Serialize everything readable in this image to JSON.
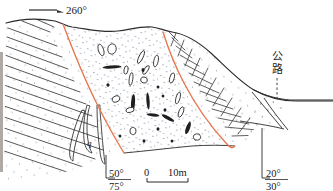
{
  "figure": {
    "type": "geological-cross-section",
    "caption_labels": {
      "direction_arrow": "260°",
      "road": "公路",
      "unit_label": "q",
      "scale_zero": "0",
      "scale_max": "10m",
      "dip_left_upper": "50°",
      "dip_left_lower": "75°",
      "dip_right_upper": "20°",
      "dip_right_lower": "30°"
    },
    "colors": {
      "fault": "#e8764c",
      "outline": "#2b2b2b",
      "hatch": "#3a3a3a",
      "stipple": "#4a5a7a",
      "text": "#1a1a1a",
      "background": "#ffffff"
    },
    "legend_notes": {
      "left_unit": "bedded rock with parallel bedding traces",
      "center_unit": "stippled breccia with scattered elongate clasts",
      "right_unit": "bedded rock with dense cross hatch"
    }
  },
  "geometry": {
    "topography": "M 6 23 C 20 19, 38 18, 55 21 C 62 23, 66 26, 72 27 C 88 29, 104 33, 118 31 C 132 29, 142 26, 152 27 C 160 28, 165 31, 172 32 C 186 34, 200 43, 212 54 C 226 67, 240 82, 254 90 C 268 98, 282 101, 296 101 L 333 101",
    "fault_left": "M 63 24 C 72 48, 84 78, 97 104 C 106 122, 116 140, 124 153",
    "fault_right": "M 163 32 C 168 48, 175 66, 184 83 C 196 106, 212 128, 226 143 C 230 148, 233 149, 235 146",
    "base_left": "M 6 23 C 4 60, 4 110, 4 168",
    "deposit_base": "M 124 153 C 146 151, 170 148, 192 146 C 208 145, 222 145, 235 146",
    "road_surface": "M 254 90 C 266 96, 278 99, 290 100 L 333 100",
    "slope_right_1": "M 252 92 C 262 104, 272 116, 282 128",
    "slope_right_2": "M 264 98 C 272 110, 280 120, 288 130",
    "slope_right_3": "M 240 121 C 252 123, 268 125, 284 129"
  },
  "bedding_lines_left": [
    {
      "x1": 8,
      "y1": 28,
      "x2": 57,
      "y2": 46
    },
    {
      "x1": 7,
      "y1": 37,
      "x2": 62,
      "y2": 57
    },
    {
      "x1": 6,
      "y1": 46,
      "x2": 68,
      "y2": 69
    },
    {
      "x1": 5,
      "y1": 55,
      "x2": 74,
      "y2": 81
    },
    {
      "x1": 5,
      "y1": 65,
      "x2": 80,
      "y2": 92
    },
    {
      "x1": 4,
      "y1": 75,
      "x2": 86,
      "y2": 104
    },
    {
      "x1": 4,
      "y1": 85,
      "x2": 92,
      "y2": 116
    },
    {
      "x1": 4,
      "y1": 95,
      "x2": 97,
      "y2": 127
    },
    {
      "x1": 4,
      "y1": 106,
      "x2": 101,
      "y2": 139
    },
    {
      "x1": 4,
      "y1": 117,
      "x2": 103,
      "y2": 150
    },
    {
      "x1": 4,
      "y1": 128,
      "x2": 95,
      "y2": 159
    },
    {
      "x1": 4,
      "y1": 140,
      "x2": 86,
      "y2": 168
    },
    {
      "x1": 4,
      "y1": 151,
      "x2": 76,
      "y2": 175
    },
    {
      "x1": 22,
      "y1": 21,
      "x2": 50,
      "y2": 32
    },
    {
      "x1": 36,
      "y1": 19,
      "x2": 54,
      "y2": 27
    }
  ],
  "hatch_lines_right": [
    {
      "x1": 168,
      "y1": 31,
      "x2": 178,
      "y2": 41
    },
    {
      "x1": 172,
      "y1": 38,
      "x2": 185,
      "y2": 50
    },
    {
      "x1": 176,
      "y1": 46,
      "x2": 192,
      "y2": 58
    },
    {
      "x1": 180,
      "y1": 55,
      "x2": 199,
      "y2": 66
    },
    {
      "x1": 184,
      "y1": 64,
      "x2": 205,
      "y2": 75
    },
    {
      "x1": 189,
      "y1": 73,
      "x2": 212,
      "y2": 84
    },
    {
      "x1": 194,
      "y1": 82,
      "x2": 219,
      "y2": 93
    },
    {
      "x1": 200,
      "y1": 91,
      "x2": 226,
      "y2": 101
    },
    {
      "x1": 206,
      "y1": 100,
      "x2": 233,
      "y2": 109
    },
    {
      "x1": 212,
      "y1": 109,
      "x2": 241,
      "y2": 117
    },
    {
      "x1": 218,
      "y1": 118,
      "x2": 249,
      "y2": 124
    },
    {
      "x1": 225,
      "y1": 127,
      "x2": 257,
      "y2": 130
    },
    {
      "x1": 232,
      "y1": 136,
      "x2": 264,
      "y2": 135
    }
  ],
  "hatch_cross_right": [
    {
      "x1": 176,
      "y1": 33,
      "x2": 171,
      "y2": 46
    },
    {
      "x1": 184,
      "y1": 40,
      "x2": 178,
      "y2": 56
    },
    {
      "x1": 192,
      "y1": 49,
      "x2": 185,
      "y2": 66
    },
    {
      "x1": 200,
      "y1": 58,
      "x2": 192,
      "y2": 76
    },
    {
      "x1": 208,
      "y1": 68,
      "x2": 199,
      "y2": 86
    },
    {
      "x1": 216,
      "y1": 78,
      "x2": 206,
      "y2": 96
    },
    {
      "x1": 224,
      "y1": 88,
      "x2": 213,
      "y2": 106
    },
    {
      "x1": 232,
      "y1": 98,
      "x2": 221,
      "y2": 116
    },
    {
      "x1": 241,
      "y1": 108,
      "x2": 229,
      "y2": 126
    },
    {
      "x1": 250,
      "y1": 118,
      "x2": 238,
      "y2": 134
    },
    {
      "x1": 259,
      "y1": 127,
      "x2": 248,
      "y2": 141
    }
  ],
  "clasts": [
    {
      "cx": 101,
      "cy": 50,
      "rx": 2.6,
      "ry": 6.0,
      "rot": -18,
      "fill": "none"
    },
    {
      "cx": 112,
      "cy": 49,
      "rx": 4.2,
      "ry": 5.2,
      "rot": 8,
      "fill": "none"
    },
    {
      "cx": 141,
      "cy": 57,
      "rx": 2.0,
      "ry": 7.0,
      "rot": 26,
      "fill": "none"
    },
    {
      "cx": 156,
      "cy": 61,
      "rx": 2.2,
      "ry": 6.0,
      "rot": 12,
      "fill": "none"
    },
    {
      "cx": 146,
      "cy": 70,
      "rx": 1.8,
      "ry": 5.0,
      "rot": 32,
      "fill": "none"
    },
    {
      "cx": 112,
      "cy": 67,
      "rx": 9.5,
      "ry": 1.6,
      "rot": -3,
      "fill": "solid"
    },
    {
      "cx": 126,
      "cy": 70,
      "rx": 2.0,
      "ry": 4.2,
      "rot": 10,
      "fill": "none"
    },
    {
      "cx": 143,
      "cy": 70,
      "rx": 1.5,
      "ry": 2.0,
      "rot": 0,
      "fill": "solid"
    },
    {
      "cx": 131,
      "cy": 79,
      "rx": 1.8,
      "ry": 6.5,
      "rot": 8,
      "fill": "none"
    },
    {
      "cx": 144,
      "cy": 80,
      "rx": 3.4,
      "ry": 3.0,
      "rot": 20,
      "fill": "none"
    },
    {
      "cx": 172,
      "cy": 78,
      "rx": 2.2,
      "ry": 5.2,
      "rot": 14,
      "fill": "none"
    },
    {
      "cx": 108,
      "cy": 85,
      "rx": 1.6,
      "ry": 1.8,
      "rot": 0,
      "fill": "solid"
    },
    {
      "cx": 158,
      "cy": 87,
      "rx": 1.4,
      "ry": 1.6,
      "rot": 0,
      "fill": "solid"
    },
    {
      "cx": 116,
      "cy": 99,
      "rx": 4.0,
      "ry": 3.0,
      "rot": -20,
      "fill": "none"
    },
    {
      "cx": 133,
      "cy": 103,
      "rx": 2.0,
      "ry": 9.0,
      "rot": 4,
      "fill": "solid"
    },
    {
      "cx": 148,
      "cy": 101,
      "rx": 1.6,
      "ry": 8.5,
      "rot": -4,
      "fill": "solid"
    },
    {
      "cx": 178,
      "cy": 98,
      "rx": 2.0,
      "ry": 6.0,
      "rot": 16,
      "fill": "none"
    },
    {
      "cx": 130,
      "cy": 110,
      "rx": 4.2,
      "ry": 2.4,
      "rot": -14,
      "fill": "none"
    },
    {
      "cx": 165,
      "cy": 110,
      "rx": 1.5,
      "ry": 1.8,
      "rot": 0,
      "fill": "solid"
    },
    {
      "cx": 181,
      "cy": 112,
      "rx": 2.2,
      "ry": 5.5,
      "rot": 22,
      "fill": "none"
    },
    {
      "cx": 168,
      "cy": 118,
      "rx": 7.0,
      "ry": 1.8,
      "rot": 28,
      "fill": "solid"
    },
    {
      "cx": 153,
      "cy": 115,
      "rx": 6.5,
      "ry": 1.5,
      "rot": 6,
      "fill": "solid"
    },
    {
      "cx": 133,
      "cy": 131,
      "rx": 3.0,
      "ry": 3.6,
      "rot": 10,
      "fill": "none"
    },
    {
      "cx": 158,
      "cy": 129,
      "rx": 1.5,
      "ry": 1.8,
      "rot": 0,
      "fill": "solid"
    },
    {
      "cx": 188,
      "cy": 128,
      "rx": 2.0,
      "ry": 6.5,
      "rot": 20,
      "fill": "solid"
    },
    {
      "cx": 197,
      "cy": 137,
      "rx": 3.6,
      "ry": 3.2,
      "rot": -10,
      "fill": "none"
    },
    {
      "cx": 144,
      "cy": 141,
      "rx": 1.5,
      "ry": 1.7,
      "rot": 0,
      "fill": "solid"
    },
    {
      "cx": 172,
      "cy": 141,
      "rx": 1.4,
      "ry": 1.6,
      "rot": 0,
      "fill": "solid"
    },
    {
      "cx": 120,
      "cy": 136,
      "rx": 1.4,
      "ry": 1.6,
      "rot": 0,
      "fill": "solid"
    },
    {
      "cx": 163,
      "cy": 96,
      "rx": 1.4,
      "ry": 1.6,
      "rot": 0,
      "fill": "solid"
    }
  ],
  "fracture_lenses": [
    "M 87 105 C 84 116, 83 128, 84 140 C 85 148, 88 152, 92 153 C 89 148, 87 138, 87 128 C 87 118, 88 110, 90 106 Z",
    "M 82 110 C 76 122, 72 136, 70 148 C 69 155, 70 160, 73 161 C 73 153, 76 140, 80 128 C 82 120, 84 114, 85 111 Z",
    "M 97 105 C 97 120, 98 138, 100 152 C 101 160, 103 164, 105 164 C 104 156, 102 138, 101 122 C 100 113, 100 108, 100 105 Z"
  ],
  "scale_bar": {
    "x_start": 147,
    "x_end": 188,
    "y": 179
  }
}
